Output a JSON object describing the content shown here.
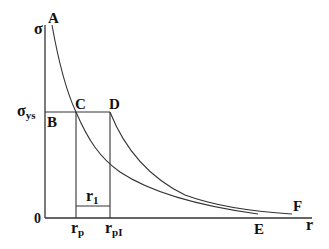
{
  "diagram": {
    "type": "stress-distribution-plot",
    "axes": {
      "y_label": "σ",
      "x_label": "r",
      "origin_label": "0"
    },
    "points": {
      "A": "A",
      "B": "B",
      "C": "C",
      "D": "D",
      "E": "E",
      "F": "F"
    },
    "levels": {
      "yield_stress": {
        "main": "σ",
        "sub": "ys"
      }
    },
    "distances": {
      "rp": {
        "main": "r",
        "sub": "p"
      },
      "rpI": {
        "main": "r",
        "sub": "pI"
      },
      "r1": {
        "main": "r",
        "sub": "1"
      }
    },
    "colors": {
      "line": "#333333",
      "text": "#111111",
      "background": "#ffffff"
    }
  }
}
